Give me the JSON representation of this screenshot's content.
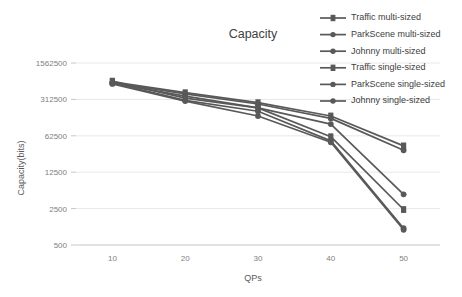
{
  "chart_data": {
    "type": "line",
    "title": "Capacity",
    "xlabel": "QPs",
    "ylabel": "Capacity(bits)",
    "x": [
      10,
      20,
      30,
      40,
      50
    ],
    "xlim": [
      5,
      55
    ],
    "xticks": [
      10,
      20,
      30,
      40,
      50
    ],
    "xtick_labels": [
      "10",
      "20",
      "30",
      "40",
      "50"
    ],
    "yticks": [
      500,
      2500,
      12500,
      62500,
      312500,
      1562500
    ],
    "ytick_labels": [
      "500",
      "2500",
      "12500",
      "62500",
      "312500",
      "1562500"
    ],
    "ylim": [
      500,
      1562500
    ],
    "yscale": "log5",
    "grid": true,
    "legend_position": "top-right",
    "series": [
      {
        "name": "Traffic multi-sized",
        "color": "#595959",
        "marker": "dash",
        "values": [
          680000,
          420000,
          270000,
          150000,
          40000
        ]
      },
      {
        "name": "ParkScene multi-sized",
        "color": "#595959",
        "marker": "dot",
        "values": [
          660000,
          400000,
          255000,
          135000,
          33000
        ]
      },
      {
        "name": "Johnny multi-sized",
        "color": "#595959",
        "marker": "dot",
        "values": [
          640000,
          360000,
          215000,
          105000,
          4700
        ]
      },
      {
        "name": "Traffic single-sized",
        "color": "#595959",
        "marker": "dash",
        "values": [
          700000,
          330000,
          215000,
          60000,
          2400
        ]
      },
      {
        "name": "ParkScene  single-sized",
        "color": "#595959",
        "marker": "dot",
        "values": [
          650000,
          300000,
          185000,
          50000,
          1050
        ]
      },
      {
        "name": "Johnny single-sized",
        "color": "#595959",
        "marker": "dot",
        "values": [
          620000,
          290000,
          150000,
          47000,
          980
        ]
      }
    ]
  }
}
